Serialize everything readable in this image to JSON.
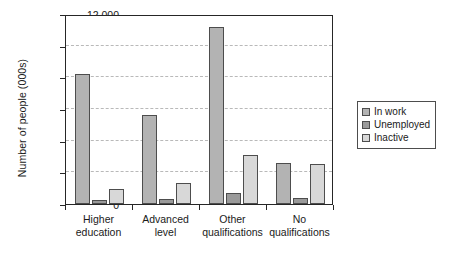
{
  "chart_data": {
    "type": "bar",
    "title": "",
    "xlabel": "",
    "ylabel": "Number of people (000s)",
    "categories": [
      "Higher education",
      "Advanced level",
      "Other qualifications",
      "No qualifications"
    ],
    "series": [
      {
        "name": "In work",
        "color": "#b3b3b3",
        "values": [
          8200,
          5650,
          11200,
          2600
        ]
      },
      {
        "name": "Unemployed",
        "color": "#9a9a9a",
        "values": [
          250,
          300,
          700,
          350
        ]
      },
      {
        "name": "Inactive",
        "color": "#d8d8d8",
        "values": [
          950,
          1350,
          3100,
          2550
        ]
      }
    ],
    "ylim": [
      0,
      12000
    ],
    "yticks": [
      0,
      2000,
      4000,
      6000,
      8000,
      10000,
      12000
    ],
    "ytick_labels": [
      "0",
      "2000",
      "4000",
      "6000",
      "8000",
      "10 000",
      "12 000"
    ],
    "grid": "horizontal-dashed",
    "legend_position": "right"
  },
  "legend": {
    "items": [
      {
        "label": "In work"
      },
      {
        "label": "Unemployed"
      },
      {
        "label": "Inactive"
      }
    ]
  },
  "xaxis": {
    "labels": [
      {
        "line1": "Higher",
        "line2": "education"
      },
      {
        "line1": "Advanced",
        "line2": "level"
      },
      {
        "line1": "Other",
        "line2": "qualifications"
      },
      {
        "line1": "No",
        "line2": "qualifications"
      }
    ]
  }
}
